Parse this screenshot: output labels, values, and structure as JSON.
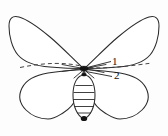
{
  "figure": {
    "title": "",
    "background_color": "#fdfdfd",
    "line_color": "#2b2b2b",
    "label_color": "#111111"
  },
  "callouts": [
    {
      "id": "callout-1",
      "label": "1",
      "target": "forewing-junction-dashed-axis"
    },
    {
      "id": "callout-2",
      "label": "2",
      "target": "thorax-body-junction"
    }
  ],
  "anatomy": {
    "left_forewing": "left-forewing",
    "right_forewing": "right-forewing",
    "left_hindwing": "left-hindwing",
    "right_hindwing": "right-hindwing",
    "abdomen": "segmented-abdomen",
    "abdomen_segment_count": 6,
    "thorax_marker": "dark-junction-dot",
    "tail_marker": "dark-tail-dot",
    "axis": "dashed-horizontal-axis"
  }
}
